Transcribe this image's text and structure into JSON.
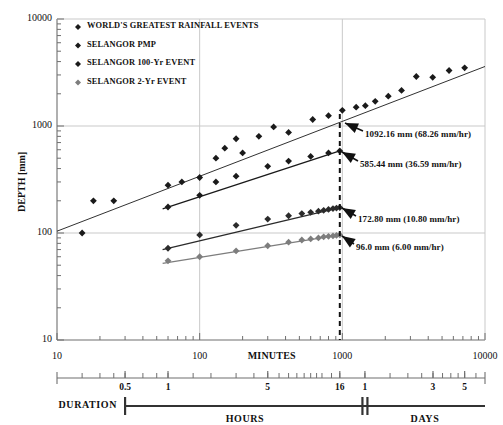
{
  "chart_data": {
    "type": "scatter",
    "title": "",
    "xlabel": "MINUTES",
    "ylabel": "DEPTH [mm]",
    "xscale": "log",
    "yscale": "log",
    "xlim": [
      10,
      10000
    ],
    "ylim": [
      10,
      10000
    ],
    "xticks": [
      "10",
      "100",
      "1000",
      "10000"
    ],
    "yticks": [
      "10",
      "100",
      "1000",
      "10000"
    ],
    "grid": true,
    "legend_position": "top-left",
    "legend": [
      "WORLD'S GREATEST RAINFALL EVENTS",
      "SELANGOR PMP",
      "SELANGOR 100-Yr EVENT",
      "SELANGOR 2-Yr EVENT"
    ],
    "series": [
      {
        "name": "WORLD'S GREATEST RAINFALL EVENTS",
        "marker": "diamond",
        "color": "#1a1a1a",
        "points": [
          [
            15,
            100
          ],
          [
            18,
            200
          ],
          [
            25,
            200
          ],
          [
            60,
            280
          ],
          [
            75,
            300
          ],
          [
            100,
            330
          ],
          [
            130,
            500
          ],
          [
            150,
            620
          ],
          [
            180,
            760
          ],
          [
            200,
            560
          ],
          [
            260,
            800
          ],
          [
            330,
            980
          ],
          [
            420,
            870
          ],
          [
            620,
            1150
          ],
          [
            800,
            1250
          ],
          [
            1000,
            1400
          ],
          [
            1250,
            1500
          ],
          [
            1450,
            1550
          ],
          [
            1700,
            1700
          ],
          [
            2100,
            1900
          ],
          [
            2600,
            2150
          ],
          [
            3300,
            2900
          ],
          [
            4300,
            2850
          ],
          [
            5600,
            3300
          ],
          [
            7200,
            3500
          ]
        ],
        "trendline": {
          "x": [
            10,
            10000
          ],
          "y": [
            104,
            3600
          ]
        }
      },
      {
        "name": "SELANGOR PMP",
        "marker": "diamond",
        "color": "#1a1a1a",
        "points": [
          [
            60,
            175
          ],
          [
            100,
            225
          ],
          [
            130,
            300
          ],
          [
            180,
            340
          ],
          [
            300,
            420
          ],
          [
            420,
            470
          ],
          [
            600,
            520
          ],
          [
            800,
            560
          ],
          [
            960,
            585.44
          ]
        ],
        "trendline": {
          "x": [
            55,
            960
          ],
          "y": [
            168,
            585
          ]
        }
      },
      {
        "name": "SELANGOR 100-Yr EVENT",
        "marker": "diamond",
        "color": "#2b2b2b",
        "points": [
          [
            60,
            72
          ],
          [
            100,
            96
          ],
          [
            180,
            118
          ],
          [
            300,
            135
          ],
          [
            420,
            145
          ],
          [
            520,
            152
          ],
          [
            600,
            156
          ],
          [
            680,
            160
          ],
          [
            740,
            163
          ],
          [
            800,
            166
          ],
          [
            860,
            169
          ],
          [
            910,
            171
          ],
          [
            960,
            172.8
          ]
        ],
        "trendline": {
          "x": [
            55,
            960
          ],
          "y": [
            70,
            172.8
          ]
        }
      },
      {
        "name": "SELANGOR 2-Yr EVENT",
        "marker": "diamond",
        "color": "#7d7d7d",
        "points": [
          [
            60,
            55
          ],
          [
            100,
            60
          ],
          [
            180,
            68
          ],
          [
            300,
            76
          ],
          [
            420,
            82
          ],
          [
            520,
            86
          ],
          [
            600,
            88
          ],
          [
            680,
            90
          ],
          [
            740,
            92
          ],
          [
            800,
            93
          ],
          [
            860,
            94
          ],
          [
            910,
            95
          ],
          [
            960,
            96.0
          ]
        ],
        "trendline": {
          "x": [
            55,
            960
          ],
          "y": [
            52,
            96
          ]
        }
      }
    ],
    "annotations": [
      {
        "text": "1092.16 mm (68.26 mm/hr)",
        "x": 960,
        "y": 1092.16
      },
      {
        "text": "585.44 mm (36.59 mm/hr)",
        "x": 960,
        "y": 585.44
      },
      {
        "text": "172.80 mm (10.80 mm/hr)",
        "x": 960,
        "y": 172.8
      },
      {
        "text": "96.0 mm (6.00 mm/hr)",
        "x": 960,
        "y": 96.0
      }
    ],
    "reference_line": {
      "x": 960,
      "style": "dashed",
      "label": "16 hours"
    }
  },
  "duration_axis": {
    "label": "DURATION",
    "hours_label": "HOURS",
    "days_label": "DAYS",
    "ticks": [
      {
        "text": "0.5",
        "minutes": 30
      },
      {
        "text": "1",
        "minutes": 60
      },
      {
        "text": "5",
        "minutes": 300
      },
      {
        "text": "16",
        "minutes": 960
      },
      {
        "text": "1",
        "minutes": 1440
      },
      {
        "text": "3",
        "minutes": 4320
      },
      {
        "text": "5",
        "minutes": 7200
      }
    ]
  },
  "colors": {
    "axis": "#6f6f6f",
    "grid": "#c9c9c9",
    "marker_dark": "#1a1a1a",
    "marker_gray": "#7d7d7d",
    "arrow": "#111111"
  }
}
